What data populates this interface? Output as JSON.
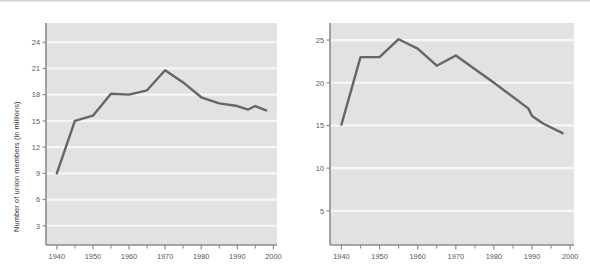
{
  "figure": {
    "background": "#ffffff",
    "plot_bg": "#e2e2e2",
    "gridline_color": "#f7f7f7",
    "line_color": "#666666",
    "axis_color": "#8d8d8d",
    "tick_text_color": "#5a5a5a"
  },
  "chart_data": [
    {
      "id": "union-members-count",
      "type": "line",
      "title": "",
      "xlabel": "",
      "ylabel": "Number of union members (in millions)",
      "xlim": [
        1937,
        2001
      ],
      "ylim": [
        0.8,
        26.2
      ],
      "xticks": [
        1940,
        1950,
        1960,
        1970,
        1980,
        1990,
        2000
      ],
      "xtick_labels": [
        "1940",
        "1950",
        "1960",
        "1970",
        "1980",
        "1990",
        "2000"
      ],
      "xminor_ticks": [
        1945,
        1955,
        1965,
        1975,
        1985,
        1995
      ],
      "yticks": [
        3,
        6,
        9,
        12,
        15,
        18,
        21,
        24
      ],
      "ytick_labels": [
        "3",
        "6",
        "9",
        "12",
        "15",
        "18",
        "21",
        "24"
      ],
      "grid": "horizontal",
      "legend": "none",
      "x": [
        1940,
        1945,
        1950,
        1955,
        1960,
        1965,
        1970,
        1975,
        1980,
        1985,
        1990,
        1993,
        1995,
        1998
      ],
      "values": [
        9.0,
        15.0,
        15.6,
        18.1,
        18.0,
        18.5,
        20.8,
        19.4,
        17.7,
        17.0,
        16.7,
        16.3,
        16.7,
        16.2
      ]
    },
    {
      "id": "union-members-percentage",
      "type": "line",
      "title": "",
      "xlabel": "",
      "ylabel": "Union members as percentage of total labor force",
      "xlim": [
        1937,
        2001
      ],
      "ylim": [
        1.0,
        27.0
      ],
      "xticks": [
        1940,
        1950,
        1960,
        1970,
        1980,
        1990,
        2000
      ],
      "xtick_labels": [
        "1940",
        "1950",
        "1960",
        "1970",
        "1980",
        "1990",
        "2000"
      ],
      "xminor_ticks": [
        1945,
        1955,
        1965,
        1975,
        1985,
        1995
      ],
      "yticks": [
        5,
        10,
        15,
        20,
        25
      ],
      "ytick_labels": [
        "5",
        "10",
        "15",
        "20",
        "25"
      ],
      "grid": "horizontal",
      "legend": "none",
      "x": [
        1940,
        1945,
        1950,
        1955,
        1960,
        1965,
        1970,
        1980,
        1989,
        1990,
        1993,
        1998
      ],
      "values": [
        15.1,
        23.0,
        23.0,
        25.1,
        24.0,
        22.0,
        23.2,
        20.0,
        17.0,
        16.1,
        15.2,
        14.1
      ]
    }
  ]
}
